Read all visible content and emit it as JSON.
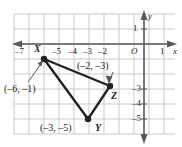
{
  "figure": {
    "type": "coordinate-plane-triangle",
    "background": "#ffffff",
    "grid_color": "#c9c9c9",
    "axis_color": "#58595b",
    "shape_color": "#231f20",
    "axes": {
      "x_axis_name": "x",
      "y_axis_name": "y",
      "origin_label": "O",
      "x_ticks": [
        "–7",
        "–5",
        "–4",
        "–3",
        "–2",
        "1"
      ],
      "y_ticks": [
        "1",
        "–3",
        "–4",
        "–5"
      ]
    },
    "vertices": [
      {
        "name": "X",
        "coord_label": "(–6, –1)",
        "x": -6,
        "y": -1
      },
      {
        "name": "Y",
        "coord_label": "(–3, –5)",
        "x": -3,
        "y": -5
      },
      {
        "name": "Z",
        "coord_label": "(–2, –3)",
        "x": -2,
        "y": -3
      }
    ]
  }
}
